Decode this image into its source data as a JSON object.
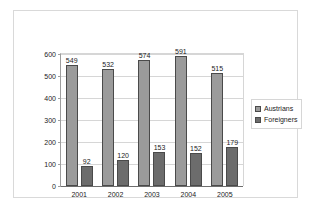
{
  "chart_data": {
    "type": "bar",
    "title": "",
    "xlabel": "",
    "ylabel": "",
    "categories": [
      "2001",
      "2002",
      "2003",
      "2004",
      "2005"
    ],
    "series": [
      {
        "name": "Austrians",
        "color": "#9b9b9b",
        "values": [
          549,
          532,
          574,
          591,
          515
        ]
      },
      {
        "name": "Foreigners",
        "color": "#6c6c6c",
        "values": [
          92,
          120,
          153,
          152,
          179
        ]
      }
    ],
    "ylim": [
      0,
      600
    ],
    "yticks": [
      0,
      100,
      200,
      300,
      400,
      500,
      600
    ],
    "ytick_labels": [
      "0",
      "100",
      "200",
      "300",
      "400",
      "500",
      "600"
    ],
    "grid": true,
    "data_labels": true,
    "legend": {
      "position": "right",
      "entries": [
        "Austrians",
        "Foreigners"
      ]
    }
  }
}
